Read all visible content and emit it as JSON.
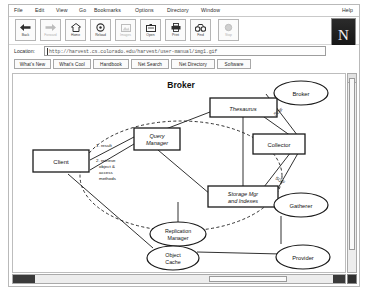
{
  "browser": {
    "menu": [
      {
        "label": "File"
      },
      {
        "label": "Edit"
      },
      {
        "label": "View"
      },
      {
        "label": "Go"
      },
      {
        "label": "Bookmarks"
      },
      {
        "label": "Options"
      },
      {
        "label": "Directory"
      },
      {
        "label": "Window"
      }
    ],
    "help_label": "Help",
    "logo_letter": "N",
    "toolbar": [
      {
        "name": "back",
        "label": "Back",
        "icon": "arrow-left-icon",
        "enabled": true
      },
      {
        "name": "forward",
        "label": "Forward",
        "icon": "arrow-right-icon",
        "enabled": false
      },
      {
        "name": "home",
        "label": "Home",
        "icon": "home-icon",
        "enabled": true
      },
      {
        "name": "reload",
        "label": "Reload",
        "icon": "reload-icon",
        "enabled": true
      },
      {
        "name": "images",
        "label": "Images",
        "icon": "images-icon",
        "enabled": false
      },
      {
        "name": "open",
        "label": "Open",
        "icon": "open-icon",
        "enabled": true
      },
      {
        "name": "print",
        "label": "Print",
        "icon": "printer-icon",
        "enabled": true
      },
      {
        "name": "find",
        "label": "Find",
        "icon": "binoculars-icon",
        "enabled": true
      },
      {
        "name": "stop",
        "label": "Stop",
        "icon": "stop-icon",
        "enabled": false
      }
    ],
    "location": {
      "label": "Location:",
      "value": "http://harvest.cs.colorado.edu/harvest/user-manual/img1.gif",
      "placeholder": "Enter URL"
    },
    "directory_buttons": [
      {
        "label": "What's New"
      },
      {
        "label": "What's Cool"
      },
      {
        "label": "Handbook"
      },
      {
        "label": "Net Search"
      },
      {
        "label": "Net Directory"
      },
      {
        "label": "Software"
      }
    ]
  },
  "diagram": {
    "title": "Broker",
    "boxes": [
      {
        "id": "client",
        "label": "Client"
      },
      {
        "id": "query-manager",
        "label": "Query\nManager"
      },
      {
        "id": "thesaurus",
        "label": "Thesaurus"
      },
      {
        "id": "storage",
        "label": "Storage Mgr\nand Indexes"
      },
      {
        "id": "collector",
        "label": "Collector"
      }
    ],
    "ellipses": [
      {
        "id": "broker-remote",
        "label": "Broker"
      },
      {
        "id": "gatherer",
        "label": "Gatherer"
      },
      {
        "id": "replication-manager",
        "label": "Replication\nManager"
      },
      {
        "id": "object-cache",
        "label": "Object\nCache"
      },
      {
        "id": "provider",
        "label": "Provider"
      }
    ],
    "edge_labels": [
      {
        "id": "step1",
        "text": "1. result"
      },
      {
        "id": "step2",
        "text": "2. retrieve\nobject &\naccess\nmethods"
      },
      {
        "id": "soif-top",
        "text": "SOIF"
      },
      {
        "id": "soif-bottom",
        "text": "SOIF"
      }
    ],
    "colors": {
      "stroke": "#1a1a1a",
      "fill": "#ffffff",
      "text": "#111111"
    }
  }
}
